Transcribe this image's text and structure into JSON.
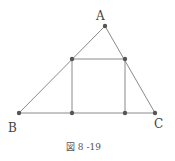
{
  "figure": {
    "caption": "図 8 -19",
    "colors": {
      "line": "#7a7a7a",
      "point": "#555555",
      "text": "#444444"
    },
    "vertices": {
      "A": {
        "label": "A",
        "x": 105,
        "y": 26
      },
      "B": {
        "label": "B",
        "x": 19,
        "y": 113
      },
      "C": {
        "label": "C",
        "x": 155,
        "y": 113
      }
    },
    "square": {
      "top_left": {
        "x": 72,
        "y": 59
      },
      "top_right": {
        "x": 125,
        "y": 59
      },
      "bottom_left": {
        "x": 72,
        "y": 113
      },
      "bottom_right": {
        "x": 125,
        "y": 113
      }
    }
  }
}
